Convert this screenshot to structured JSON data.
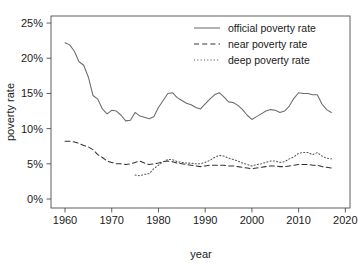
{
  "chart_data": {
    "type": "line",
    "title": "",
    "xlabel": "year",
    "ylabel": "poverty rate",
    "xlim": [
      1957,
      2021
    ],
    "ylim": [
      0,
      26
    ],
    "grid": false,
    "legend_position": "top-right",
    "xticks": [
      1960,
      1970,
      1980,
      1990,
      2000,
      2010,
      2020
    ],
    "xtick_labels": [
      "1960",
      "1970",
      "1980",
      "1990",
      "2000",
      "2010",
      "2020"
    ],
    "yticks": [
      0,
      5,
      10,
      15,
      20,
      25
    ],
    "ytick_labels": [
      "0%",
      "5%",
      "10%",
      "15%",
      "20%",
      "25%"
    ],
    "series": [
      {
        "name": "official poverty rate",
        "style": "solid",
        "color": "#6b6b6b",
        "x": [
          1960,
          1961,
          1962,
          1963,
          1964,
          1965,
          1966,
          1967,
          1968,
          1969,
          1970,
          1971,
          1972,
          1973,
          1974,
          1975,
          1976,
          1977,
          1978,
          1979,
          1980,
          1981,
          1982,
          1983,
          1984,
          1985,
          1986,
          1987,
          1988,
          1989,
          1990,
          1991,
          1992,
          1993,
          1994,
          1995,
          1996,
          1997,
          1998,
          1999,
          2000,
          2001,
          2002,
          2003,
          2004,
          2005,
          2006,
          2007,
          2008,
          2009,
          2010,
          2011,
          2012,
          2013,
          2014,
          2015,
          2016,
          2017
        ],
        "values": [
          22.2,
          21.9,
          21.0,
          19.5,
          19.0,
          17.3,
          14.7,
          14.2,
          12.8,
          12.1,
          12.6,
          12.5,
          11.9,
          11.1,
          11.2,
          12.3,
          11.8,
          11.6,
          11.4,
          11.7,
          13.0,
          14.0,
          15.0,
          15.1,
          14.4,
          14.0,
          13.6,
          13.4,
          13.0,
          12.8,
          13.5,
          14.2,
          14.8,
          15.1,
          14.5,
          13.8,
          13.7,
          13.3,
          12.7,
          11.9,
          11.3,
          11.7,
          12.1,
          12.5,
          12.7,
          12.6,
          12.3,
          12.5,
          13.2,
          14.3,
          15.1,
          15.0,
          15.0,
          14.8,
          14.8,
          13.5,
          12.7,
          12.3
        ]
      },
      {
        "name": "near poverty rate",
        "style": "dashed",
        "color": "#333333",
        "x": [
          1960,
          1961,
          1962,
          1963,
          1964,
          1965,
          1966,
          1967,
          1968,
          1969,
          1970,
          1971,
          1972,
          1973,
          1974,
          1975,
          1976,
          1977,
          1978,
          1979,
          1980,
          1981,
          1982,
          1983,
          1984,
          1985,
          1986,
          1987,
          1988,
          1989,
          1990,
          1991,
          1992,
          1993,
          1994,
          1995,
          1996,
          1997,
          1998,
          1999,
          2000,
          2001,
          2002,
          2003,
          2004,
          2005,
          2006,
          2007,
          2008,
          2009,
          2010,
          2011,
          2012,
          2013,
          2014,
          2015,
          2016,
          2017
        ],
        "values": [
          8.2,
          8.2,
          8.1,
          7.9,
          7.6,
          7.4,
          7.0,
          6.3,
          5.9,
          5.4,
          5.2,
          5.0,
          5.0,
          4.9,
          5.0,
          5.2,
          5.4,
          5.1,
          4.9,
          5.0,
          5.1,
          5.3,
          5.4,
          5.3,
          5.1,
          5.0,
          4.9,
          4.8,
          4.7,
          4.6,
          4.7,
          4.8,
          4.8,
          4.8,
          4.8,
          4.7,
          4.7,
          4.6,
          4.5,
          4.4,
          4.3,
          4.4,
          4.5,
          4.6,
          4.7,
          4.7,
          4.6,
          4.6,
          4.7,
          4.8,
          4.9,
          4.9,
          4.9,
          4.8,
          4.8,
          4.6,
          4.5,
          4.4
        ]
      },
      {
        "name": "deep poverty rate",
        "style": "dotted",
        "color": "#555555",
        "x": [
          1975,
          1976,
          1977,
          1978,
          1979,
          1980,
          1981,
          1982,
          1983,
          1984,
          1985,
          1986,
          1987,
          1988,
          1989,
          1990,
          1991,
          1992,
          1993,
          1994,
          1995,
          1996,
          1997,
          1998,
          1999,
          2000,
          2001,
          2002,
          2003,
          2004,
          2005,
          2006,
          2007,
          2008,
          2009,
          2010,
          2011,
          2012,
          2013,
          2014,
          2015,
          2016,
          2017
        ],
        "values": [
          3.4,
          3.3,
          3.5,
          3.6,
          4.3,
          4.8,
          5.3,
          5.6,
          5.6,
          5.3,
          5.2,
          5.1,
          5.1,
          5.0,
          5.0,
          5.2,
          5.5,
          5.9,
          6.2,
          6.1,
          5.8,
          5.6,
          5.4,
          5.1,
          4.9,
          4.7,
          4.9,
          5.0,
          5.2,
          5.4,
          5.4,
          5.2,
          5.3,
          5.7,
          6.0,
          6.5,
          6.6,
          6.6,
          6.3,
          6.6,
          6.1,
          5.8,
          5.7
        ]
      }
    ]
  },
  "legend": {
    "entries": [
      {
        "label": "official poverty rate",
        "style": "solid"
      },
      {
        "label": "near poverty rate",
        "style": "dashed"
      },
      {
        "label": "deep poverty rate",
        "style": "dotted"
      }
    ]
  },
  "axes": {
    "x_title": "year",
    "y_title": "poverty rate"
  }
}
